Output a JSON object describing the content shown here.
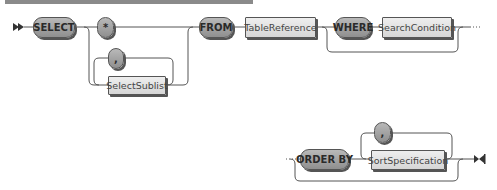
{
  "diagram": {
    "type": "railroad-syntax-diagram",
    "row1": {
      "start_marker": "double-arrow-start",
      "keyword_select": "SELECT",
      "option_star": "*",
      "option_sublist": "SelectSublist",
      "sublist_separator": ",",
      "keyword_from": "FROM",
      "table_reference": "TableReference",
      "keyword_where": "WHERE",
      "search_condition": "SearchCondition",
      "continuation": "dotted-continuation"
    },
    "row2": {
      "continuation": "dotted-continuation",
      "keyword_order_by": "ORDER BY",
      "sort_specification": "SortSpecification",
      "sort_separator": ",",
      "end_marker": "end-bowtie"
    },
    "colors": {
      "keyword_fill": "#a3a3a3",
      "reference_fill": "#e4e4e4",
      "line": "#555555",
      "top_bar": "#8a8a8a"
    }
  }
}
